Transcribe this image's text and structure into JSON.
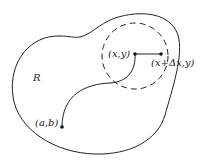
{
  "diagram": {
    "region_label": "R",
    "point_start": {
      "label": "(a,b)",
      "x": 62,
      "y": 127
    },
    "point_xy": {
      "label": "(x,y)",
      "x": 135,
      "y": 54
    },
    "point_dx": {
      "label": "(x+Δx,y)",
      "x": 161,
      "y": 54
    },
    "dashed_circle": {
      "cx": 135,
      "cy": 56,
      "r": 33
    },
    "stroke_color": "#222222"
  }
}
